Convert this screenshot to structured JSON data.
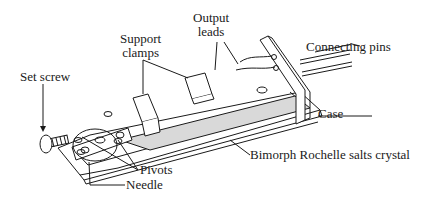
{
  "diagram": {
    "labels": {
      "support_clamps": [
        "Support",
        "clamps"
      ],
      "output_leads": [
        "Output",
        "leads"
      ],
      "connecting_pins": "Connecting pins",
      "set_screw": "Set screw",
      "case": "Case",
      "bimorph": "Bimorph Rochelle salts crystal",
      "pivots": "Pivots",
      "needle": "Needle"
    },
    "colors": {
      "ink": "#1a1a1a",
      "shade": "#d9d9d9",
      "background": "#ffffff"
    }
  }
}
